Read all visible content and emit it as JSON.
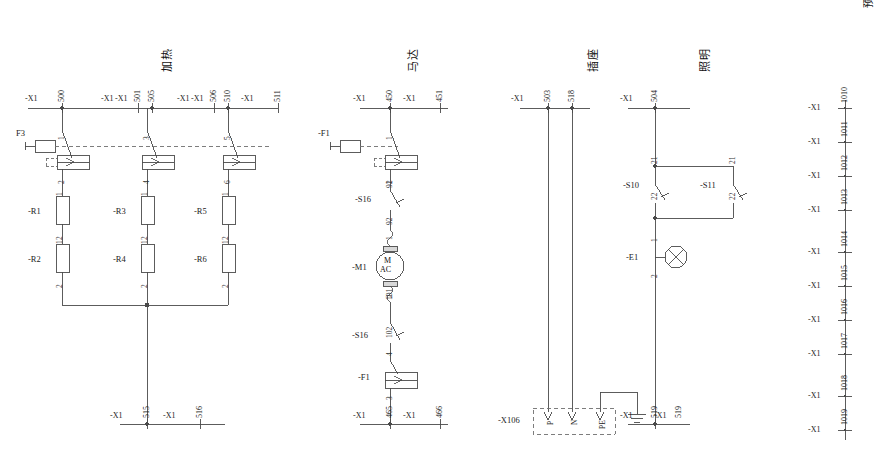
{
  "sheet": {
    "sections": [
      {
        "id": "heating",
        "title": "加热",
        "title_x": 152,
        "title_y": 62
      },
      {
        "id": "motor",
        "title": "马达",
        "title_x": 398,
        "title_y": 62
      },
      {
        "id": "socket",
        "title": "插座",
        "title_x": 578,
        "title_y": 62
      },
      {
        "id": "lighting",
        "title": "照明",
        "title_x": 690,
        "title_y": 62
      }
    ],
    "right_column_title": "预留接线端子排"
  },
  "prefix": "-X1",
  "heating": {
    "top_terminals": [
      {
        "prefix": "-X1",
        "num": "500",
        "x": 62
      },
      {
        "prefix": "-X1",
        "num": "501",
        "x": 138
      },
      {
        "prefix": "-X1",
        "num": "505",
        "x": 152
      },
      {
        "prefix": "-X1",
        "num": "506",
        "x": 214
      },
      {
        "prefix": "-X1",
        "num": "510",
        "x": 228
      },
      {
        "prefix": "-X1",
        "num": "511",
        "x": 278
      }
    ],
    "fuse_label": "F3",
    "branches": [
      {
        "contactor_top": "1",
        "contactor_bot": "2",
        "r_upper": "-R1",
        "r_lower": "-R2",
        "x": 62
      },
      {
        "contactor_top": "3",
        "contactor_bot": "4",
        "r_upper": "-R3",
        "r_lower": "-R4",
        "x": 147
      },
      {
        "contactor_top": "5",
        "contactor_bot": "6",
        "r_upper": "-R5",
        "r_lower": "-R6",
        "x": 228
      }
    ],
    "resistor_pins": {
      "top": "1",
      "bottom": "2"
    },
    "bottom_terminals": [
      {
        "prefix": "-X1",
        "num": "515",
        "x": 147
      },
      {
        "prefix": "-X1",
        "num": "516",
        "x": 200
      }
    ]
  },
  "motor": {
    "top_terminals": [
      {
        "prefix": "-X1",
        "num": "450",
        "x": 390
      },
      {
        "prefix": "-X1",
        "num": "451",
        "x": 440
      }
    ],
    "fuse_label": "-F1",
    "contactor_top": "1",
    "contactor_bot": "2",
    "switch_upper": {
      "name": "-S16",
      "top": "91",
      "bottom": "92"
    },
    "motor_pin_top": "1",
    "motor_pin_bot": "2",
    "motor_label": "-M1",
    "motor_text_top": "M",
    "motor_text_bot": "AC",
    "switch_lower": {
      "name": "-S16",
      "top": "101",
      "bottom": "102"
    },
    "fuse_lower": {
      "name": "-F1",
      "top": "4",
      "bottom": "3"
    },
    "bottom_terminals": [
      {
        "prefix": "-X1",
        "num": "465",
        "x": 390
      },
      {
        "prefix": "-X1",
        "num": "466",
        "x": 440
      }
    ]
  },
  "socket": {
    "top_terminals": [
      {
        "prefix": "-X1",
        "num": "503",
        "x": 548
      },
      {
        "prefix": "-X1",
        "num": "518",
        "x": 572
      }
    ],
    "block_label": "-X106",
    "pins": [
      {
        "name": "P",
        "x": 548
      },
      {
        "name": "N",
        "x": 572
      },
      {
        "name": "PE",
        "x": 600
      }
    ],
    "earth_terminal": {
      "prefix": "-X1",
      "num": "519",
      "x": 637
    }
  },
  "lighting": {
    "top_terminal": {
      "prefix": "-X1",
      "num": "504",
      "x": 655
    },
    "switches": [
      {
        "name": "-S10",
        "top": "21",
        "bottom": "22",
        "x": 655
      },
      {
        "name": "-S11",
        "top": "21",
        "bottom": "22",
        "x": 733
      }
    ],
    "lamp": {
      "name": "-E1",
      "top": "1",
      "bottom": "2"
    },
    "bottom_terminal": {
      "prefix": "-X1",
      "num": "519",
      "x": 655
    }
  },
  "reserved_terminals": [
    {
      "prefix": "-X1",
      "num": "1010",
      "y": 108
    },
    {
      "prefix": "-X1",
      "num": "1011",
      "y": 142
    },
    {
      "prefix": "-X1",
      "num": "1012",
      "y": 176
    },
    {
      "prefix": "-X1",
      "num": "1013",
      "y": 210
    },
    {
      "prefix": "-X1",
      "num": "1014",
      "y": 252
    },
    {
      "prefix": "-X1",
      "num": "1015",
      "y": 286
    },
    {
      "prefix": "-X1",
      "num": "1016",
      "y": 320
    },
    {
      "prefix": "-X1",
      "num": "1017",
      "y": 354
    },
    {
      "prefix": "-X1",
      "num": "1018",
      "y": 396
    },
    {
      "prefix": "-X1",
      "num": "1019",
      "y": 430
    }
  ],
  "colors": {
    "wire": "#4a4a4a",
    "text": "#1a1a1a",
    "dashed": "#6f6f6f"
  }
}
